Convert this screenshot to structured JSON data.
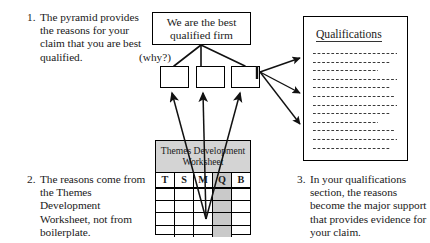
{
  "notes": [
    {
      "number": "1.",
      "text": "The pyramid provides the reasons for your claim that you are best qualified."
    },
    {
      "number": "2.",
      "text": "The reasons come from the Themes Development Worksheet, not from boilerplate."
    },
    {
      "number": "3.",
      "text": "In your qualifications section, the reasons become the major support that provides evidence for your claim."
    }
  ],
  "pyramid": {
    "claim": "We are the best qualified firm",
    "why_label": "(why?)",
    "reason_boxes": [
      "",
      "",
      ""
    ]
  },
  "qualifications_doc": {
    "title": "Qualifications",
    "line_count": 12
  },
  "worksheet": {
    "title": "Themes Development Worksheet",
    "columns": [
      "T",
      "S",
      "M",
      "Q",
      "B"
    ],
    "highlighted_column": "Q",
    "body_row_count": 4
  },
  "colors": {
    "ink": "#1a1a1a",
    "rule": "#000000",
    "header_fill": "#d4d4d4",
    "column_fill": "#c9c9c9",
    "page": "#ffffff"
  }
}
